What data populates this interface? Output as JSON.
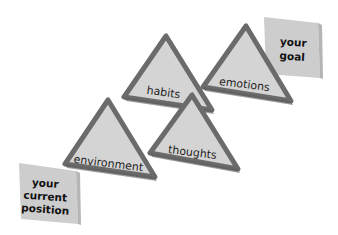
{
  "diagram": {
    "type": "process-path",
    "colors": {
      "background": "#ffffff",
      "triangle_fill": "#d3d3d3",
      "triangle_border": "#6d6d6d",
      "box_fill": "#cfcfcf",
      "box_side": "#b8b8b8",
      "text": "#1e1e1e"
    },
    "start_box": {
      "lines": [
        "your",
        "current",
        "position"
      ]
    },
    "end_box": {
      "lines": [
        "your",
        "goal"
      ]
    },
    "triangles": [
      {
        "label": "environment"
      },
      {
        "label": "thoughts"
      },
      {
        "label": "habits"
      },
      {
        "label": "emotions"
      }
    ]
  }
}
